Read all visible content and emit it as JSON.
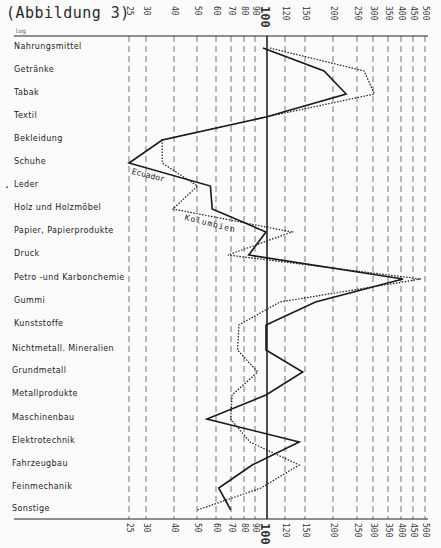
{
  "title": "(Abbildung 3)",
  "scale_note": "log",
  "chart_data": {
    "type": "line",
    "title": "(Abbildung 3)",
    "orientation": "horizontal-categories-vertical",
    "xscale": "log",
    "xlabel": "",
    "ylabel": "",
    "xlim": [
      25,
      500
    ],
    "reference_line": 100,
    "ticks": [
      25,
      30,
      40,
      50,
      60,
      70,
      80,
      90,
      100,
      120,
      150,
      200,
      250,
      300,
      350,
      400,
      450,
      500
    ],
    "grid": true,
    "categories": [
      "Nahrungsmittel",
      "Getränke",
      "Tabak",
      "Textil",
      "Bekleidung",
      "Schuhe",
      "Leder",
      "Holz und Holzmöbel",
      "Papier, Papierprodukte",
      "Druck",
      "Petro -und Karbonchemie",
      "Gummi",
      "Kunststoffe",
      "Nichtmetall. Mineralien",
      "Grundmetall",
      "Metallprodukte",
      "Maschinenbau",
      "Elektrotechnik",
      "Fahrzeugbau",
      "Feinmechanik",
      "Sonstige"
    ],
    "series": [
      {
        "name": "Ecuador",
        "style": "solid",
        "values": [
          97,
          180,
          225,
          100,
          35,
          25,
          57,
          58,
          100,
          84,
          400,
          165,
          100,
          100,
          145,
          100,
          55,
          140,
          87,
          62,
          70
        ]
      },
      {
        "name": "Kolumbien",
        "style": "dotted",
        "values": [
          104,
          270,
          300,
          100,
          35,
          35,
          50,
          39,
          130,
          68,
          480,
          115,
          76,
          75,
          92,
          71,
          70,
          85,
          140,
          95,
          50
        ]
      }
    ],
    "annotations": [
      "Ecuador",
      "Kolumbien"
    ]
  },
  "axis": {
    "ticks": [
      {
        "label": "25",
        "x": 129
      },
      {
        "label": "30",
        "x": 146
      },
      {
        "label": "40",
        "x": 174
      },
      {
        "label": "50",
        "x": 197
      },
      {
        "label": "60",
        "x": 216
      },
      {
        "label": "70",
        "x": 231
      },
      {
        "label": "80",
        "x": 244
      },
      {
        "label": "90",
        "x": 255
      },
      {
        "label": "100",
        "x": 267
      },
      {
        "label": "120",
        "x": 285
      },
      {
        "label": "150",
        "x": 305
      },
      {
        "label": "200",
        "x": 333
      },
      {
        "label": "250",
        "x": 357
      },
      {
        "label": "300",
        "x": 373
      },
      {
        "label": "350",
        "x": 388
      },
      {
        "label": "400",
        "x": 401
      },
      {
        "label": "450",
        "x": 413
      },
      {
        "label": "500",
        "x": 425
      }
    ]
  },
  "rows_y": [
    48,
    71,
    94,
    117,
    140,
    163,
    186,
    209,
    232,
    255,
    279,
    302,
    325,
    350,
    372,
    395,
    419,
    442,
    465,
    488,
    510
  ],
  "labels": {
    "ecuador": "Ecuador",
    "kolumbien": "Kolumbien",
    "leder_marker": "·"
  }
}
